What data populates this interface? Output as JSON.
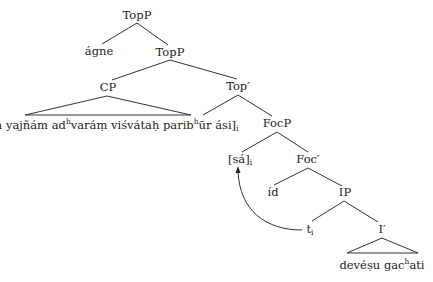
{
  "diagram": {
    "type": "syntax-tree",
    "nodes": {
      "toppRoot": "TopP",
      "agne": "ágne",
      "toppInner": "TopP",
      "cp": "CP",
      "cpContent": {
        "pre1": "[yáṃ yajñám ad",
        "sup1": "h",
        "mid": "varáṃ viśvátaḥ parib",
        "sup2": "h",
        "post": "ūr ási]",
        "sub": "i"
      },
      "topBar": "Top′",
      "focp": "FocP",
      "sa": {
        "text": "[sá]",
        "sub": "i"
      },
      "focBar": "Foc′",
      "id": "íd",
      "ip": "IP",
      "trace": {
        "text": "t",
        "sub": "i"
      },
      "iBar": "I′",
      "iContent": {
        "pre": "devéṣu gac",
        "sup": "h",
        "post": "ati"
      }
    },
    "edges": [
      [
        "TopP",
        "ágne"
      ],
      [
        "TopP",
        "TopP"
      ],
      [
        "TopP",
        "CP"
      ],
      [
        "TopP",
        "Top′"
      ],
      [
        "Top′",
        "[yáṃ ... ási]i"
      ],
      [
        "Top′",
        "FocP"
      ],
      [
        "FocP",
        "[sá]i"
      ],
      [
        "FocP",
        "Foc′"
      ],
      [
        "Foc′",
        "íd"
      ],
      [
        "Foc′",
        "IP"
      ],
      [
        "IP",
        "ti"
      ],
      [
        "IP",
        "I′"
      ]
    ],
    "movement_arrow": {
      "from": "ti",
      "to": "[sá]i"
    },
    "colors": {
      "line": "#333333",
      "text": "#222222",
      "background": "#ffffff"
    }
  }
}
